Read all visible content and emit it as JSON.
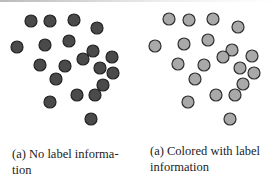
{
  "panels": [
    {
      "caption": "(a) No label informa-tion",
      "caption_line1": "(a) No label informa-",
      "caption_line2": "tion",
      "dot_fill": "#4a4a4a",
      "dot_stroke": "#222222",
      "dots": [
        [
          31,
          21
        ],
        [
          50,
          21
        ],
        [
          74,
          20
        ],
        [
          97,
          28
        ],
        [
          17,
          47
        ],
        [
          45,
          45
        ],
        [
          69,
          41
        ],
        [
          93,
          51
        ],
        [
          83,
          59
        ],
        [
          112,
          57
        ],
        [
          40,
          65
        ],
        [
          65,
          66
        ],
        [
          100,
          68
        ],
        [
          113,
          73
        ],
        [
          56,
          79
        ],
        [
          103,
          85
        ],
        [
          77,
          95
        ],
        [
          95,
          95
        ],
        [
          50,
          102
        ],
        [
          91,
          119
        ]
      ]
    },
    {
      "caption": "(a) Colored with label information",
      "caption_line1": "(a) Colored with label",
      "caption_line2": "information",
      "dot_fill": "#a9a9a9",
      "dot_stroke": "#2e2e2e",
      "dots": [
        [
          169,
          19
        ],
        [
          189,
          20
        ],
        [
          213,
          19
        ],
        [
          238,
          27
        ],
        [
          155,
          46
        ],
        [
          184,
          44
        ],
        [
          208,
          40
        ],
        [
          232,
          50
        ],
        [
          223,
          57
        ],
        [
          252,
          56
        ],
        [
          178,
          64
        ],
        [
          204,
          65
        ],
        [
          240,
          68
        ],
        [
          254,
          73
        ],
        [
          195,
          79
        ],
        [
          243,
          84
        ],
        [
          216,
          95
        ],
        [
          235,
          95
        ],
        [
          188,
          102
        ],
        [
          230,
          119
        ]
      ]
    }
  ],
  "dot_radius": 6
}
